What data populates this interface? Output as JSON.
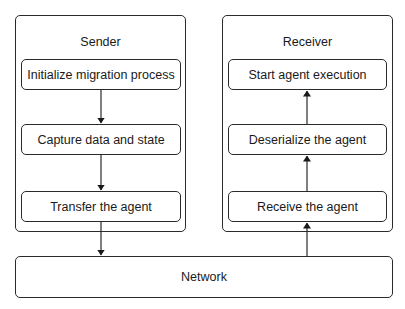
{
  "diagram": {
    "sender": {
      "title": "Sender",
      "steps": [
        {
          "label": "Initialize migration process"
        },
        {
          "label": "Capture data and state"
        },
        {
          "label": "Transfer the agent"
        }
      ],
      "flow_direction": "down"
    },
    "receiver": {
      "title": "Receiver",
      "steps": [
        {
          "label": "Start agent execution"
        },
        {
          "label": "Deserialize the agent"
        },
        {
          "label": "Receive the agent"
        }
      ],
      "flow_direction": "up"
    },
    "network": {
      "label": "Network"
    },
    "edges": [
      {
        "from": "Initialize migration process",
        "to": "Capture data and state"
      },
      {
        "from": "Capture data and state",
        "to": "Transfer the agent"
      },
      {
        "from": "Transfer the agent",
        "to": "Network"
      },
      {
        "from": "Network",
        "to": "Receive the agent"
      },
      {
        "from": "Receive the agent",
        "to": "Deserialize the agent"
      },
      {
        "from": "Deserialize the agent",
        "to": "Start agent execution"
      }
    ],
    "colors": {
      "stroke": "#2a2a2a",
      "background": "#ffffff",
      "text": "#1a1a1a"
    }
  }
}
